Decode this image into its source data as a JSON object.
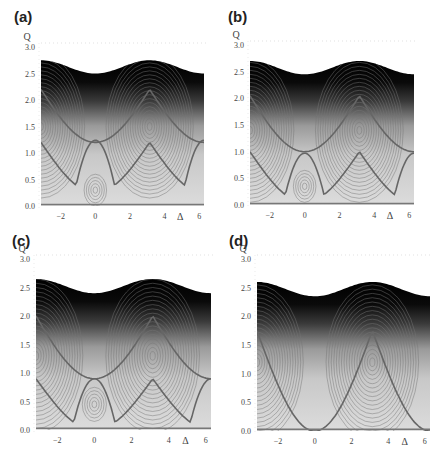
{
  "figure": {
    "panels": [
      {
        "id": "a",
        "label": "(a)"
      },
      {
        "id": "b",
        "label": "(b)"
      },
      {
        "id": "c",
        "label": "(c)"
      },
      {
        "id": "d",
        "label": "(d)"
      }
    ]
  },
  "chart_data": [
    {
      "type": "heatmap",
      "title": "(a)",
      "xlabel": "Δ",
      "ylabel": "Q",
      "xlim": [
        -3.14,
        6.28
      ],
      "ylim": [
        0.0,
        3.0
      ],
      "xticks": [
        -2,
        0,
        2,
        4,
        6
      ],
      "yticks": [
        "0.0",
        "0.5",
        "1.0",
        "1.5",
        "2.0",
        "2.5",
        "3.0"
      ],
      "top_boundary": {
        "max_Q": 2.75,
        "min_Q": 2.5,
        "max_at": [
          -3.14,
          3.14
        ],
        "min_at": [
          0,
          6.28
        ]
      },
      "separatrix": {
        "crossing": [
          0,
          1.2
        ],
        "peak_Q": 2.2,
        "trough_Q": 0.25
      },
      "centers": [
        {
          "delta": 3.14,
          "Q": 1.5
        },
        {
          "delta": -3.14,
          "Q": 1.5
        },
        {
          "delta": 0,
          "Q": 0.3
        }
      ],
      "grid": false,
      "colormap": "gray: dark at high Q, light at low Q"
    },
    {
      "type": "heatmap",
      "title": "(b)",
      "xlabel": "Δ",
      "ylabel": "Q",
      "xlim": [
        -3.14,
        6.28
      ],
      "ylim": [
        0.0,
        3.0
      ],
      "xticks": [
        -2,
        0,
        2,
        4,
        6
      ],
      "yticks": [
        "0.0",
        "0.5",
        "1.0",
        "1.5",
        "2.0",
        "2.5",
        "3.0"
      ],
      "top_boundary": {
        "max_Q": 2.7,
        "min_Q": 2.45,
        "max_at": [
          -3.14,
          3.14
        ],
        "min_at": [
          0,
          6.28
        ]
      },
      "separatrix": {
        "crossing": [
          0,
          1.0
        ],
        "peak_Q": 2.05,
        "trough_Q": 0.05
      },
      "centers": [
        {
          "delta": 3.14,
          "Q": 1.4
        },
        {
          "delta": -3.14,
          "Q": 1.4
        },
        {
          "delta": 0,
          "Q": 0.35
        }
      ],
      "grid": false,
      "colormap": "gray: dark at high Q, light at low Q"
    },
    {
      "type": "heatmap",
      "title": "(c)",
      "xlabel": "Δ",
      "ylabel": "Q",
      "xlim": [
        -3.14,
        6.28
      ],
      "ylim": [
        0.0,
        3.0
      ],
      "xticks": [
        -2,
        0,
        2,
        4,
        6
      ],
      "yticks": [
        "0.0",
        "0.5",
        "1.0",
        "1.5",
        "2.0",
        "2.5",
        "3.0"
      ],
      "top_boundary": {
        "max_Q": 2.65,
        "min_Q": 2.4,
        "max_at": [
          -3.14,
          3.14
        ],
        "min_at": [
          0,
          6.28
        ]
      },
      "separatrix": {
        "crossing": [
          0,
          0.9
        ],
        "peak_Q": 2.0,
        "trough_Q": 0.0
      },
      "centers": [
        {
          "delta": 3.14,
          "Q": 1.3
        },
        {
          "delta": -3.14,
          "Q": 1.3
        },
        {
          "delta": 0,
          "Q": 0.45
        }
      ],
      "grid": false,
      "colormap": "gray: dark at high Q, light at low Q"
    },
    {
      "type": "heatmap",
      "title": "(d)",
      "xlabel": "Δ",
      "ylabel": "Q",
      "xlim": [
        -3.14,
        6.28
      ],
      "ylim": [
        0.0,
        3.0
      ],
      "xticks": [
        -2,
        0,
        2,
        4,
        6
      ],
      "yticks": [
        "0.0",
        "0.5",
        "1.0",
        "1.5",
        "2.0",
        "2.5",
        "3.0"
      ],
      "top_boundary": {
        "max_Q": 2.6,
        "min_Q": 2.35,
        "max_at": [
          -3.14,
          3.14
        ],
        "min_at": [
          0,
          6.28
        ]
      },
      "separatrix": {
        "crossing": null,
        "peak_Q": 1.75,
        "trough_Q": 0.0
      },
      "centers": [
        {
          "delta": 3.14,
          "Q": 1.2
        },
        {
          "delta": -3.14,
          "Q": 1.2
        }
      ],
      "grid": false,
      "colormap": "gray: dark at high Q, light at low Q"
    }
  ],
  "layout": {
    "panels": [
      {
        "label_x": 14,
        "label_y": 8,
        "px0": 41,
        "px1": 204,
        "py0": 206,
        "py3": 47
      },
      {
        "label_x": 228,
        "label_y": 8,
        "px0": 250,
        "px1": 414,
        "py0": 205,
        "py3": 45
      },
      {
        "label_x": 12,
        "label_y": 232,
        "px0": 36,
        "px1": 211,
        "py0": 430,
        "py3": 259
      },
      {
        "label_x": 229,
        "label_y": 232,
        "px0": 257,
        "px1": 430,
        "py0": 431,
        "py3": 259
      }
    ]
  }
}
